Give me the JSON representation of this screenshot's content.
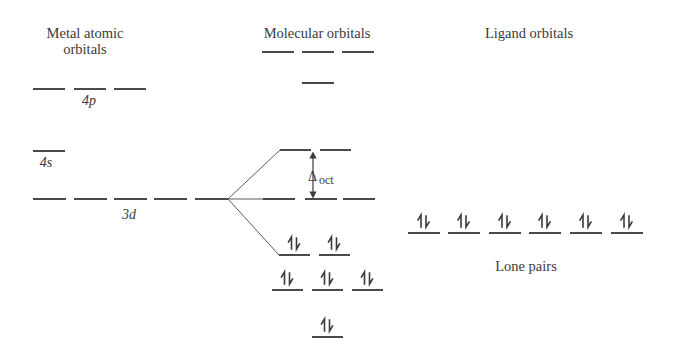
{
  "headers": {
    "metal_line1": "Metal atomic",
    "metal_line2": "orbitals",
    "molecular": "Molecular orbitals",
    "ligand": "Ligand orbitals"
  },
  "labels": {
    "metal_4p": "4p",
    "metal_4s": "4s",
    "metal_3d": "3d",
    "delta_symbol": "Δ",
    "delta_subscript": "oct",
    "lone_pairs": "Lone pairs"
  },
  "colors": {
    "level_line": "#4a4a4a",
    "connector": "#5a5a5a",
    "text": "#3a3a3a"
  },
  "diagram": {
    "levels": [
      {
        "name": "metal-4p-orbital",
        "group": "metal",
        "y": 89,
        "x": [
          33,
          74,
          114
        ],
        "w": 32,
        "electron_pairs": 0
      },
      {
        "name": "metal-4s-orbital",
        "group": "metal",
        "y": 151,
        "x": [
          33
        ],
        "w": 32,
        "electron_pairs": 0
      },
      {
        "name": "metal-3d-orbital",
        "group": "metal",
        "y": 199,
        "x": [
          33,
          74,
          114,
          154,
          195
        ],
        "w": 33,
        "electron_pairs": 0
      },
      {
        "name": "mo-antibonding-top",
        "group": "molecular",
        "y": 52,
        "x": [
          262,
          302,
          342
        ],
        "w": 32,
        "electron_pairs": 0
      },
      {
        "name": "mo-antibonding-single",
        "group": "molecular",
        "y": 83,
        "x": [
          302
        ],
        "w": 32,
        "electron_pairs": 0
      },
      {
        "name": "mo-eg-upper",
        "group": "molecular",
        "y": 150,
        "x": [
          280,
          320
        ],
        "w": 31,
        "electron_pairs": 0
      },
      {
        "name": "mo-middle",
        "group": "molecular",
        "y": 199,
        "x": [
          263,
          305,
          343
        ],
        "w": 32,
        "electron_pairs": 0
      },
      {
        "name": "mo-t2g-filled",
        "group": "molecular",
        "y": 255,
        "x": [
          279,
          319
        ],
        "w": 31,
        "electron_pairs": 2
      },
      {
        "name": "mo-bonding-triple",
        "group": "molecular",
        "y": 290,
        "x": [
          272,
          312,
          352
        ],
        "w": 31,
        "electron_pairs": 3
      },
      {
        "name": "mo-bonding-single",
        "group": "molecular",
        "y": 337,
        "x": [
          312
        ],
        "w": 31,
        "electron_pairs": 1
      },
      {
        "name": "ligand-lone-pair-orbital",
        "group": "ligand",
        "y": 233,
        "x": [
          408,
          448,
          489,
          529,
          570,
          611
        ],
        "w": 32,
        "electron_pairs": 6
      }
    ],
    "connectors": [
      {
        "name": "split-connector-up",
        "from": [
          228,
          199
        ],
        "to": [
          280,
          150
        ]
      },
      {
        "name": "split-connector-mid",
        "from": [
          228,
          199
        ],
        "to": [
          263,
          199
        ]
      },
      {
        "name": "split-connector-down",
        "from": [
          228,
          199
        ],
        "to": [
          279,
          255
        ]
      }
    ],
    "delta_arrow": {
      "x": 313,
      "y_top": 152,
      "y_bottom": 198
    }
  }
}
